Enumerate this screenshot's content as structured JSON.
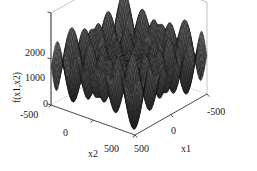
{
  "figure": {
    "background_color": "#ffffff",
    "surface_color": "#2b2b2b",
    "mesh_line_color": "#111111",
    "box_line_color": "#aaaaaa",
    "axis_line_color": "#333333",
    "text_color": "#1a1a1a"
  },
  "axes": {
    "z": {
      "title": "f(x1,x2)",
      "ticks": [
        "2000",
        "1000",
        "0"
      ],
      "tick_values": [
        2000,
        1000,
        0
      ]
    },
    "x2": {
      "title": "x2",
      "ticks": [
        "-500",
        "0",
        "500"
      ],
      "tick_values": [
        -500,
        0,
        500
      ]
    },
    "x1": {
      "title": "x1",
      "ticks": [
        "500",
        "0",
        "-500"
      ],
      "tick_values": [
        500,
        0,
        -500
      ]
    }
  },
  "chart_data": {
    "type": "surface",
    "title": "",
    "xlabel": "x1",
    "ylabel": "x2",
    "zlabel": "f(x1,x2)",
    "xlim": [
      -500,
      500
    ],
    "ylim": [
      -500,
      500
    ],
    "zlim": [
      0,
      2000
    ],
    "grid": true,
    "legend": "none",
    "x_ticks": [
      -500,
      0,
      500
    ],
    "y_ticks": [
      -500,
      0,
      500
    ],
    "z_ticks": [
      0,
      1000,
      2000
    ],
    "function": "schwefel",
    "function_expression": "418.9829*2 - x1*sin(sqrt(abs(x1))) - x2*sin(sqrt(abs(x2)))",
    "grid_resolution": 64,
    "view_azimuth": -37.5,
    "view_elevation": 30,
    "shading": "mesh",
    "z_min_observed": 0,
    "z_max_observed": 2000
  }
}
